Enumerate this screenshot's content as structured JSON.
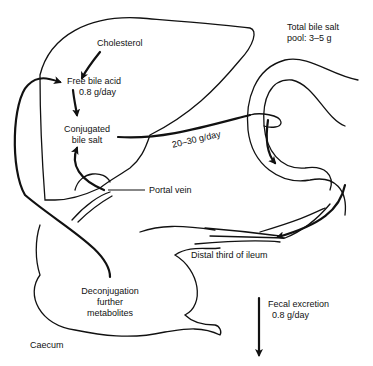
{
  "diagram": {
    "labels": {
      "cholesterol": "Cholesterol",
      "free_bile_acid": "Free bile acid",
      "synthesis_rate": "0.8 g/day",
      "conjugated_line1": "Conjugated",
      "conjugated_line2": "bile salt",
      "flow_rate": "20–30 g/day",
      "pool_line1": "Total bile salt",
      "pool_line2": "pool: 3–5 g",
      "portal_vein": "Portal  vein",
      "distal_ileum": "Distal third of ileum",
      "deconj_line1": "Deconjugation",
      "deconj_line2": "further",
      "deconj_line3": "metabolites",
      "fecal_line1": "Fecal excretion",
      "fecal_line2": "0.8 g/day",
      "caecum": "Caecum"
    },
    "colors": {
      "stroke": "#111111",
      "background": "#ffffff"
    }
  }
}
